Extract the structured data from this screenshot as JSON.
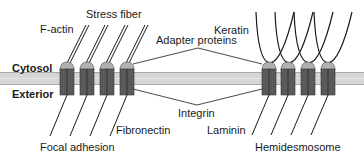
{
  "regions": {
    "cytosol": "Cytosol",
    "exterior": "Exterior"
  },
  "labels": {
    "f_actin": "F-actin",
    "stress_fiber": "Stress fiber",
    "adapter_proteins": "Adapter proteins",
    "keratin": "Keratin",
    "integrin": "Integrin",
    "fibronectin": "Fibronectin",
    "laminin": "Laminin",
    "focal_adhesion": "Focal adhesion",
    "hemidesmosome": "Hemidesmosome"
  },
  "junctions": [
    {
      "name": "Focal adhesion",
      "integrin_count": 4,
      "cytoskeleton": "Stress fiber (F-actin)",
      "matrix": "Fibronectin"
    },
    {
      "name": "Hemidesmosome",
      "integrin_count": 4,
      "cytoskeleton": "Keratin",
      "matrix": "Laminin"
    }
  ],
  "colors": {
    "membrane": "#d4d4d4",
    "membrane_edge": "#a8a8a8",
    "integrin_body": "#5a5a5a",
    "integrin_divider": "#2a2a2a",
    "adapter_cap": "#b0b0b0",
    "line": "#1a1a1a"
  }
}
